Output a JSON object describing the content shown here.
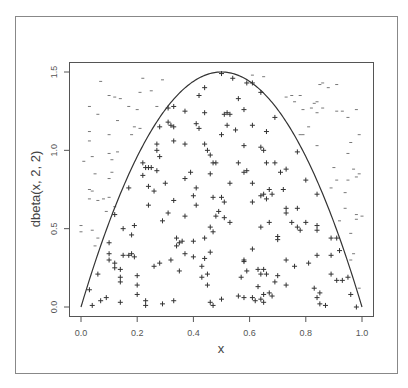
{
  "chart_data": {
    "type": "scatter",
    "title": "",
    "xlabel": "x",
    "ylabel": "dbeta(x, 2, 2)",
    "xlim": [
      0,
      1
    ],
    "ylim": [
      0,
      1.5
    ],
    "x_ticks": [
      "0.0",
      "0.2",
      "0.4",
      "0.6",
      "0.8",
      "1.0"
    ],
    "y_ticks": [
      "0.0",
      "0.5",
      "1.0",
      "1.5"
    ],
    "grid": false,
    "legend": null,
    "curve": {
      "name": "dbeta(x, 2, 2)",
      "formula": "6*x*(1-x)",
      "color": "#333333"
    },
    "series": [
      {
        "name": "accepted",
        "marker": "+",
        "color": "#333333",
        "points": [
          [
            0.5,
            1.49
          ],
          [
            0.54,
            1.46
          ],
          [
            0.59,
            1.43
          ],
          [
            0.61,
            1.43
          ],
          [
            0.44,
            1.4
          ],
          [
            0.42,
            1.35
          ],
          [
            0.56,
            1.33
          ],
          [
            0.64,
            1.37
          ],
          [
            0.31,
            1.27
          ],
          [
            0.33,
            1.28
          ],
          [
            0.37,
            1.25
          ],
          [
            0.44,
            1.24
          ],
          [
            0.51,
            1.23
          ],
          [
            0.52,
            1.24
          ],
          [
            0.53,
            1.23
          ],
          [
            0.58,
            1.26
          ],
          [
            0.69,
            1.21
          ],
          [
            0.31,
            1.18
          ],
          [
            0.32,
            1.16
          ],
          [
            0.33,
            1.15
          ],
          [
            0.41,
            1.17
          ],
          [
            0.42,
            1.14
          ],
          [
            0.52,
            1.16
          ],
          [
            0.61,
            1.16
          ],
          [
            0.28,
            1.15
          ],
          [
            0.55,
            1.13
          ],
          [
            0.66,
            1.12
          ],
          [
            0.5,
            1.1
          ],
          [
            0.33,
            1.06
          ],
          [
            0.37,
            1.04
          ],
          [
            0.27,
            1.04
          ],
          [
            0.44,
            1.04
          ],
          [
            0.58,
            1.03
          ],
          [
            0.64,
            1.02
          ],
          [
            0.65,
            1.0
          ],
          [
            0.45,
            1.0
          ],
          [
            0.27,
            1.0
          ],
          [
            0.46,
            0.97
          ],
          [
            0.28,
            0.96
          ],
          [
            0.77,
            0.99
          ],
          [
            0.22,
            0.92
          ],
          [
            0.47,
            0.92
          ],
          [
            0.48,
            0.92
          ],
          [
            0.56,
            0.92
          ],
          [
            0.66,
            0.92
          ],
          [
            0.69,
            0.92
          ],
          [
            0.23,
            0.89
          ],
          [
            0.24,
            0.89
          ],
          [
            0.25,
            0.89
          ],
          [
            0.27,
            0.87
          ],
          [
            0.39,
            0.86
          ],
          [
            0.46,
            0.85
          ],
          [
            0.58,
            0.86
          ],
          [
            0.59,
            0.87
          ],
          [
            0.73,
            0.88
          ],
          [
            0.71,
            0.86
          ],
          [
            0.22,
            0.84
          ],
          [
            0.37,
            0.82
          ],
          [
            0.3,
            0.79
          ],
          [
            0.53,
            0.79
          ],
          [
            0.61,
            0.79
          ],
          [
            0.8,
            0.81
          ],
          [
            0.24,
            0.77
          ],
          [
            0.17,
            0.76
          ],
          [
            0.26,
            0.74
          ],
          [
            0.41,
            0.76
          ],
          [
            0.67,
            0.75
          ],
          [
            0.72,
            0.75
          ],
          [
            0.64,
            0.71
          ],
          [
            0.65,
            0.72
          ],
          [
            0.68,
            0.72
          ],
          [
            0.4,
            0.71
          ],
          [
            0.47,
            0.7
          ],
          [
            0.5,
            0.7
          ],
          [
            0.66,
            0.69
          ],
          [
            0.84,
            0.72
          ],
          [
            0.33,
            0.68
          ],
          [
            0.51,
            0.67
          ],
          [
            0.61,
            0.67
          ],
          [
            0.24,
            0.65
          ],
          [
            0.41,
            0.65
          ],
          [
            0.73,
            0.63
          ],
          [
            0.77,
            0.63
          ],
          [
            0.31,
            0.6
          ],
          [
            0.49,
            0.61
          ],
          [
            0.73,
            0.6
          ],
          [
            0.12,
            0.59
          ],
          [
            0.37,
            0.58
          ],
          [
            0.48,
            0.58
          ],
          [
            0.51,
            0.57
          ],
          [
            0.29,
            0.55
          ],
          [
            0.53,
            0.54
          ],
          [
            0.67,
            0.54
          ],
          [
            0.75,
            0.54
          ],
          [
            0.8,
            0.54
          ],
          [
            0.19,
            0.52
          ],
          [
            0.46,
            0.51
          ],
          [
            0.64,
            0.51
          ],
          [
            0.77,
            0.51
          ],
          [
            0.84,
            0.52
          ],
          [
            0.15,
            0.5
          ],
          [
            0.47,
            0.48
          ],
          [
            0.78,
            0.49
          ],
          [
            0.84,
            0.49
          ],
          [
            0.18,
            0.46
          ],
          [
            0.34,
            0.44
          ],
          [
            0.44,
            0.44
          ],
          [
            0.7,
            0.45
          ],
          [
            0.7,
            0.43
          ],
          [
            0.89,
            0.44
          ],
          [
            0.91,
            0.44
          ],
          [
            0.1,
            0.41
          ],
          [
            0.35,
            0.41
          ],
          [
            0.36,
            0.42
          ],
          [
            0.4,
            0.42
          ],
          [
            0.34,
            0.39
          ],
          [
            0.61,
            0.37
          ],
          [
            0.92,
            0.36
          ],
          [
            0.1,
            0.34
          ],
          [
            0.18,
            0.34
          ],
          [
            0.15,
            0.33
          ],
          [
            0.17,
            0.33
          ],
          [
            0.19,
            0.32
          ],
          [
            0.37,
            0.34
          ],
          [
            0.4,
            0.32
          ],
          [
            0.44,
            0.31
          ],
          [
            0.46,
            0.35
          ],
          [
            0.58,
            0.3
          ],
          [
            0.58,
            0.29
          ],
          [
            0.73,
            0.3
          ],
          [
            0.84,
            0.33
          ],
          [
            0.89,
            0.33
          ],
          [
            0.1,
            0.3
          ],
          [
            0.12,
            0.28
          ],
          [
            0.28,
            0.28
          ],
          [
            0.32,
            0.3
          ],
          [
            0.76,
            0.26
          ],
          [
            0.81,
            0.28
          ],
          [
            0.26,
            0.26
          ],
          [
            0.43,
            0.26
          ],
          [
            0.12,
            0.25
          ],
          [
            0.14,
            0.24
          ],
          [
            0.35,
            0.23
          ],
          [
            0.59,
            0.23
          ],
          [
            0.63,
            0.24
          ],
          [
            0.65,
            0.24
          ],
          [
            0.06,
            0.21
          ],
          [
            0.14,
            0.19
          ],
          [
            0.2,
            0.2
          ],
          [
            0.43,
            0.19
          ],
          [
            0.45,
            0.21
          ],
          [
            0.57,
            0.19
          ],
          [
            0.64,
            0.21
          ],
          [
            0.66,
            0.21
          ],
          [
            0.7,
            0.2
          ],
          [
            0.89,
            0.21
          ],
          [
            0.95,
            0.19
          ],
          [
            0.14,
            0.16
          ],
          [
            0.2,
            0.14
          ],
          [
            0.45,
            0.14
          ],
          [
            0.69,
            0.16
          ],
          [
            0.73,
            0.14
          ],
          [
            0.91,
            0.17
          ],
          [
            0.93,
            0.17
          ],
          [
            0.03,
            0.11
          ],
          [
            0.63,
            0.13
          ],
          [
            0.83,
            0.12
          ],
          [
            0.2,
            0.08
          ],
          [
            0.56,
            0.07
          ],
          [
            0.65,
            0.08
          ],
          [
            0.67,
            0.09
          ],
          [
            0.68,
            0.07
          ],
          [
            0.85,
            0.09
          ],
          [
            0.96,
            0.08
          ],
          [
            0.09,
            0.06
          ],
          [
            0.07,
            0.04
          ],
          [
            0.58,
            0.06
          ],
          [
            0.61,
            0.06
          ],
          [
            0.64,
            0.05
          ],
          [
            0.62,
            0.04
          ],
          [
            0.84,
            0.06
          ],
          [
            0.5,
            0.05
          ],
          [
            0.23,
            0.04
          ],
          [
            0.14,
            0.03
          ],
          [
            0.33,
            0.04
          ],
          [
            0.65,
            0.03
          ],
          [
            0.04,
            0.01
          ],
          [
            0.23,
            0.01
          ],
          [
            0.29,
            0.02
          ],
          [
            0.46,
            0.03
          ],
          [
            0.47,
            0.01
          ],
          [
            0.85,
            0.02
          ],
          [
            0.87,
            0.01
          ],
          [
            0.98,
            0.0
          ]
        ]
      },
      {
        "name": "rejected",
        "marker": "-",
        "color": "#555555",
        "points": [
          [
            0.07,
            1.44
          ],
          [
            0.22,
            1.46
          ],
          [
            0.29,
            1.45
          ],
          [
            0.61,
            1.48
          ],
          [
            0.65,
            1.47
          ],
          [
            0.85,
            1.42
          ],
          [
            0.86,
            1.43
          ],
          [
            0.91,
            1.42
          ],
          [
            0.88,
            1.4
          ],
          [
            0.21,
            1.37
          ],
          [
            0.25,
            1.38
          ],
          [
            0.1,
            1.35
          ],
          [
            0.12,
            1.34
          ],
          [
            0.14,
            1.33
          ],
          [
            0.73,
            1.34
          ],
          [
            0.75,
            1.35
          ],
          [
            0.78,
            1.35
          ],
          [
            0.76,
            1.31
          ],
          [
            0.83,
            1.3
          ],
          [
            0.84,
            1.31
          ],
          [
            0.03,
            1.28
          ],
          [
            0.17,
            1.28
          ],
          [
            0.2,
            1.26
          ],
          [
            0.27,
            1.28
          ],
          [
            0.79,
            1.26
          ],
          [
            0.82,
            1.27
          ],
          [
            0.86,
            1.27
          ],
          [
            0.91,
            1.25
          ],
          [
            0.93,
            1.25
          ],
          [
            0.98,
            1.26
          ],
          [
            0.06,
            1.23
          ],
          [
            0.84,
            1.24
          ],
          [
            0.95,
            1.21
          ],
          [
            0.13,
            1.19
          ],
          [
            0.21,
            1.14
          ],
          [
            0.19,
            1.15
          ],
          [
            0.81,
            1.15
          ],
          [
            0.03,
            1.12
          ],
          [
            0.1,
            1.1
          ],
          [
            0.18,
            1.1
          ],
          [
            0.78,
            1.1
          ],
          [
            0.79,
            1.1
          ],
          [
            0.99,
            1.1
          ],
          [
            0.03,
            1.06
          ],
          [
            0.84,
            1.03
          ],
          [
            0.96,
            1.05
          ],
          [
            0.04,
            0.96
          ],
          [
            0.1,
            0.98
          ],
          [
            0.13,
            0.99
          ],
          [
            0.01,
            0.93
          ],
          [
            0.11,
            0.94
          ],
          [
            0.95,
            0.98
          ],
          [
            0.05,
            0.85
          ],
          [
            0.11,
            0.86
          ],
          [
            0.9,
            0.89
          ],
          [
            0.97,
            0.88
          ],
          [
            0.1,
            0.82
          ],
          [
            0.91,
            0.81
          ],
          [
            0.95,
            0.81
          ],
          [
            0.99,
            0.85
          ],
          [
            0.98,
            0.83
          ],
          [
            0.03,
            0.75
          ],
          [
            0.04,
            0.74
          ],
          [
            0.03,
            0.69
          ],
          [
            0.06,
            0.68
          ],
          [
            0.08,
            0.69
          ],
          [
            0.1,
            0.7
          ],
          [
            0.89,
            0.76
          ],
          [
            0.94,
            0.73
          ],
          [
            0.12,
            0.64
          ],
          [
            0.94,
            0.63
          ],
          [
            0.09,
            0.61
          ],
          [
            0.98,
            0.59
          ],
          [
            0.0,
            0.52
          ],
          [
            0.92,
            0.55
          ],
          [
            0.98,
            0.56
          ],
          [
            1.0,
            0.58
          ],
          [
            0.0,
            0.48
          ],
          [
            0.04,
            0.49
          ],
          [
            0.06,
            0.44
          ],
          [
            0.96,
            0.47
          ],
          [
            0.05,
            0.39
          ],
          [
            0.97,
            0.34
          ],
          [
            0.96,
            0.3
          ],
          [
            0.99,
            0.12
          ]
        ]
      }
    ]
  },
  "labels": {
    "xlabel": "x",
    "ylabel": "dbeta(x, 2, 2)",
    "x_ticks": [
      "0.0",
      "0.2",
      "0.4",
      "0.6",
      "0.8",
      "1.0"
    ],
    "y_ticks": [
      "0.0",
      "0.5",
      "1.0",
      "1.5"
    ]
  }
}
